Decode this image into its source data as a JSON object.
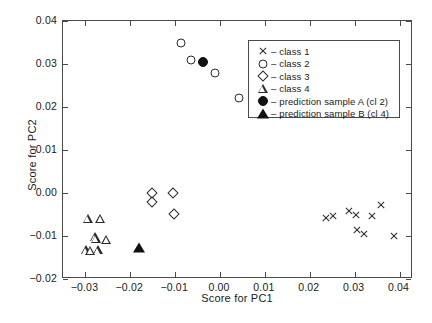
{
  "chart_data": {
    "type": "scatter",
    "title": "",
    "xlabel": "Score for PC1",
    "ylabel": "Score for PC2",
    "xlim": [
      -0.035,
      0.043
    ],
    "ylim": [
      -0.02,
      0.04
    ],
    "xticks": [
      "-0.03",
      "-0.02",
      "-0.01",
      "0.00",
      "0.01",
      "0.02",
      "0.03",
      "0.04"
    ],
    "xtick_values": [
      -0.03,
      -0.02,
      -0.01,
      0.0,
      0.01,
      0.02,
      0.03,
      0.04
    ],
    "yticks": [
      "-0.02",
      "-0.01",
      "0.00",
      "0.01",
      "0.02",
      "0.03",
      "0.04"
    ],
    "ytick_values": [
      -0.02,
      -0.01,
      0.0,
      0.01,
      0.02,
      0.03,
      0.04
    ],
    "grid": false,
    "legend_position": "upper right",
    "series": [
      {
        "name": "class 1",
        "marker": "x",
        "fill": "none",
        "color": "#2b2b2b",
        "points": [
          [
            0.0236,
            -0.0059
          ],
          [
            0.0252,
            -0.0053
          ],
          [
            0.0288,
            -0.0042
          ],
          [
            0.0302,
            -0.005
          ],
          [
            0.0306,
            -0.0087
          ],
          [
            0.032,
            -0.0096
          ],
          [
            0.0338,
            -0.0054
          ],
          [
            0.0358,
            -0.0028
          ],
          [
            0.0388,
            -0.0099
          ]
        ]
      },
      {
        "name": "class 2",
        "marker": "circle",
        "fill": "none",
        "color": "#2b2b2b",
        "points": [
          [
            -0.0086,
            0.0349
          ],
          [
            -0.0064,
            0.0309
          ],
          [
            -0.0011,
            0.0279
          ],
          [
            0.0042,
            0.022
          ]
        ]
      },
      {
        "name": "class 3",
        "marker": "diamond",
        "fill": "none",
        "color": "#2b2b2b",
        "points": [
          [
            -0.0152,
            0.0
          ],
          [
            -0.0152,
            -0.0021
          ],
          [
            -0.0104,
            0.0
          ],
          [
            -0.0102,
            -0.0048
          ]
        ]
      },
      {
        "name": "class 4",
        "marker": "triangle",
        "fill": "none",
        "color": "#2b2b2b",
        "points": [
          [
            -0.0294,
            -0.006
          ],
          [
            -0.0266,
            -0.006
          ],
          [
            -0.0278,
            -0.0103
          ],
          [
            -0.0276,
            -0.0106
          ],
          [
            -0.0252,
            -0.0109
          ],
          [
            -0.0298,
            -0.0133
          ],
          [
            -0.0288,
            -0.0134
          ],
          [
            -0.0272,
            -0.0133
          ]
        ]
      },
      {
        "name": "prediction sample A (cl 2)",
        "marker": "circle",
        "fill": "solid",
        "color": "#111111",
        "points": [
          [
            -0.0038,
            0.0304
          ]
        ]
      },
      {
        "name": "prediction sample B (cl 4)",
        "marker": "triangle",
        "fill": "solid",
        "color": "#111111",
        "points": [
          [
            -0.018,
            -0.0128
          ]
        ]
      }
    ],
    "legend": [
      {
        "symbol": "x",
        "fill": "none",
        "dash": "–",
        "label": "class 1"
      },
      {
        "symbol": "circle",
        "fill": "none",
        "dash": "–",
        "label": "class 2"
      },
      {
        "symbol": "diamond",
        "fill": "none",
        "dash": "–",
        "label": "class 3"
      },
      {
        "symbol": "triangle",
        "fill": "none",
        "dash": "–",
        "label": "class 4"
      },
      {
        "symbol": "circle",
        "fill": "solid",
        "dash": "–",
        "label": "prediction sample A (cl 2)"
      },
      {
        "symbol": "triangle",
        "fill": "solid",
        "dash": "–",
        "label": "prediction sample B (cl 4)"
      }
    ]
  }
}
